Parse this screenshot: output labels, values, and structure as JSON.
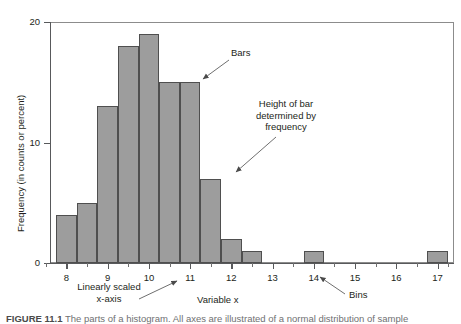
{
  "figure": {
    "caption_label": "FIGURE 11.1",
    "caption_text": "The parts of a histogram. All axes are illustrated of a normal distribution of sample"
  },
  "chart_data": {
    "type": "bar",
    "title": "",
    "xlabel": "Variable x",
    "ylabel": "Frequency (in counts or percent)",
    "xlim": [
      7.6,
      17.4
    ],
    "ylim": [
      0,
      20
    ],
    "bin_width": 0.5,
    "grid": false,
    "legend": "none",
    "bar_color": "#9d9d9d",
    "bar_edge_color": "#4f4f4f",
    "x_ticks": [
      "8",
      "9",
      "10",
      "11",
      "12",
      "13",
      "14",
      "15",
      "16",
      "17"
    ],
    "x_tick_values": [
      8,
      9,
      10,
      11,
      12,
      13,
      14,
      15,
      16,
      17
    ],
    "x_minor_tick_values": [
      7.5,
      8.5,
      9.5,
      10.5,
      11.5,
      12.5,
      13.5,
      14.5,
      15.5,
      16.5,
      17.25
    ],
    "y_ticks": [
      "0",
      "10",
      "20"
    ],
    "y_tick_values": [
      0,
      10,
      20
    ],
    "bins": [
      {
        "left": 7.75,
        "right": 8.25,
        "center": 8.0,
        "value": 4
      },
      {
        "left": 8.25,
        "right": 8.75,
        "center": 8.5,
        "value": 5
      },
      {
        "left": 8.75,
        "right": 9.25,
        "center": 9.0,
        "value": 13
      },
      {
        "left": 9.25,
        "right": 9.75,
        "center": 9.5,
        "value": 18
      },
      {
        "left": 9.75,
        "right": 10.25,
        "center": 10.0,
        "value": 19
      },
      {
        "left": 10.25,
        "right": 10.75,
        "center": 10.5,
        "value": 15
      },
      {
        "left": 10.75,
        "right": 11.25,
        "center": 11.0,
        "value": 15
      },
      {
        "left": 11.25,
        "right": 11.75,
        "center": 11.5,
        "value": 7
      },
      {
        "left": 11.75,
        "right": 12.25,
        "center": 12.0,
        "value": 2
      },
      {
        "left": 12.25,
        "right": 12.75,
        "center": 12.5,
        "value": 1
      },
      {
        "left": 13.75,
        "right": 14.25,
        "center": 14.0,
        "value": 1
      },
      {
        "left": 16.75,
        "right": 17.25,
        "center": 17.0,
        "value": 1
      }
    ]
  },
  "annotations": {
    "bars": "Bars",
    "height_of_bar": "Height of bar\ndetermined by\nfrequency",
    "linear_axis": "Linearly scaled\nx-axis",
    "bins": "Bins"
  }
}
